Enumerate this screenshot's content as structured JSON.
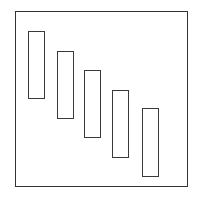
{
  "diagram": {
    "frame": {
      "x": 15,
      "y": 11,
      "w": 173,
      "h": 176,
      "stroke": "#333333"
    },
    "bars": [
      {
        "x": 28,
        "y": 31,
        "w": 17,
        "h": 68
      },
      {
        "x": 57,
        "y": 51,
        "w": 17,
        "h": 68
      },
      {
        "x": 84,
        "y": 70,
        "w": 17,
        "h": 68
      },
      {
        "x": 112,
        "y": 90,
        "w": 17,
        "h": 68
      },
      {
        "x": 142,
        "y": 108,
        "w": 17,
        "h": 69
      }
    ],
    "caption": ""
  }
}
